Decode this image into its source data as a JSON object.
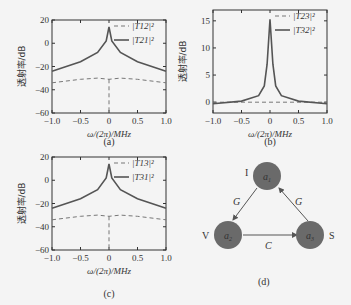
{
  "chart_data": [
    {
      "panel": "(a)",
      "type": "line",
      "title": "",
      "xlabel": "ω/(2π)/MHz",
      "ylabel": "透射率/dB",
      "xlim": [
        -1.0,
        1.0
      ],
      "ylim": [
        -60,
        20
      ],
      "xticks": [
        "-1.0",
        "-0.5",
        "0",
        "0.5",
        "1.0"
      ],
      "yticks": [
        "20",
        "0",
        "-20",
        "-40",
        "-60"
      ],
      "legend": "top-right",
      "series": [
        {
          "name": "|T12|²",
          "style": "dashed",
          "x": [
            -1.0,
            -0.5,
            -0.2,
            0,
            0.2,
            0.5,
            1.0
          ],
          "y": [
            -34,
            -31,
            -30,
            -31,
            -30,
            -31,
            -34
          ],
          "note": "vertical dashed dip at 0 down to -60"
        },
        {
          "name": "|T21|²",
          "style": "solid",
          "x": [
            -1.0,
            -0.5,
            -0.2,
            -0.05,
            0,
            0.05,
            0.2,
            0.5,
            1.0
          ],
          "y": [
            -24,
            -16,
            -8,
            2,
            14,
            2,
            -8,
            -16,
            -24
          ]
        }
      ]
    },
    {
      "panel": "(b)",
      "type": "line",
      "xlabel": "ω/(2π)/MHz",
      "ylabel": "透射率/dB",
      "xlim": [
        -1.0,
        1.0
      ],
      "ylim": [
        -2,
        17
      ],
      "xticks": [
        "-1.0",
        "-0.5",
        "0",
        "0.5",
        "1.0"
      ],
      "yticks": [
        "15",
        "10",
        "5",
        "0"
      ],
      "legend": "top-right",
      "series": [
        {
          "name": "|T23|²",
          "style": "dashed",
          "x": [
            -1.0,
            1.0
          ],
          "y": [
            0,
            0
          ]
        },
        {
          "name": "|T32|²",
          "style": "solid",
          "x": [
            -1.0,
            -0.5,
            -0.2,
            -0.1,
            -0.05,
            0,
            0.05,
            0.1,
            0.2,
            0.5,
            1.0
          ],
          "y": [
            -0.3,
            0.2,
            1.2,
            3,
            7,
            15.3,
            7,
            3,
            1.2,
            0.2,
            -0.3
          ]
        }
      ]
    },
    {
      "panel": "(c)",
      "type": "line",
      "xlabel": "ω/(2π)/MHz",
      "ylabel": "透射率/dB",
      "xlim": [
        -1.0,
        1.0
      ],
      "ylim": [
        -60,
        20
      ],
      "xticks": [
        "-1.0",
        "-0.5",
        "0",
        "0.5",
        "1.0"
      ],
      "yticks": [
        "20",
        "0",
        "-20",
        "-40",
        "-60"
      ],
      "legend": "top-right",
      "series": [
        {
          "name": "|T13|²",
          "style": "dashed",
          "x": [
            -1.0,
            -0.5,
            -0.2,
            0,
            0.2,
            0.5,
            1.0
          ],
          "y": [
            -34,
            -31,
            -30,
            -31,
            -30,
            -31,
            -34
          ],
          "note": "vertical dashed dip at 0 down to -60"
        },
        {
          "name": "|T31|²",
          "style": "solid",
          "x": [
            -1.0,
            -0.5,
            -0.2,
            -0.05,
            0,
            0.05,
            0.2,
            0.5,
            1.0
          ],
          "y": [
            -24,
            -16,
            -8,
            2,
            14,
            2,
            -8,
            -16,
            -24
          ]
        }
      ]
    }
  ],
  "captions": {
    "a": "(a)",
    "b": "(b)",
    "c": "(c)",
    "d": "(d)"
  },
  "diagram": {
    "nodes": [
      {
        "id": "a1",
        "label": "a",
        "sub": "1",
        "side_label": "I"
      },
      {
        "id": "a2",
        "label": "a",
        "sub": "2",
        "side_label": "V"
      },
      {
        "id": "a3",
        "label": "a",
        "sub": "3",
        "side_label": "S"
      }
    ],
    "edges": [
      {
        "from": "a1",
        "to": "a2",
        "label": "G"
      },
      {
        "from": "a2",
        "to": "a3",
        "label": "C"
      },
      {
        "from": "a3",
        "to": "a1",
        "label": "G"
      }
    ],
    "node_color": "#6a6a6a"
  }
}
